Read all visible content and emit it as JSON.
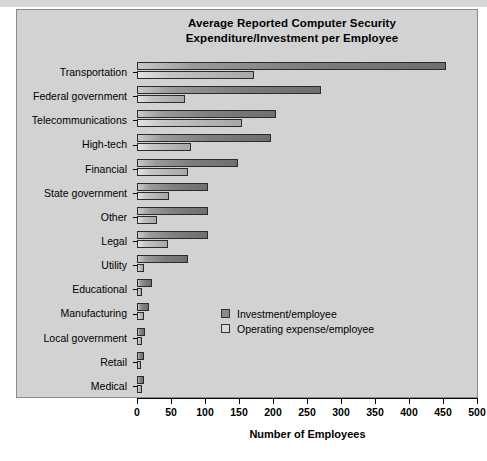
{
  "chart_data": {
    "type": "bar",
    "orientation": "horizontal",
    "title": "Average Reported Computer Security Expenditure/Investment per Employee",
    "title_lines": [
      "Average Reported Computer Security",
      "Expenditure/Investment per Employee"
    ],
    "xlabel": "Number of Employees",
    "ylabel": "",
    "xlim": [
      0,
      500
    ],
    "xticks": [
      0,
      50,
      100,
      150,
      200,
      250,
      300,
      350,
      400,
      450,
      500
    ],
    "xtick_labels": [
      "0",
      "50",
      "100",
      "150",
      "200",
      "250",
      "300",
      "350",
      "400",
      "450",
      "500"
    ],
    "grid": false,
    "legend_position": "center-right",
    "categories": [
      "Transportation",
      "Federal government",
      "Telecommunications",
      "High-tech",
      "Financial",
      "State government",
      "Other",
      "Legal",
      "Utility",
      "Educational",
      "Manufacturing",
      "Local government",
      "Retail",
      "Medical"
    ],
    "series": [
      {
        "name": "Investment/employee",
        "color": "#7d7d7d",
        "values": [
          455,
          270,
          205,
          197,
          148,
          105,
          105,
          105,
          75,
          22,
          17,
          12,
          11,
          10
        ]
      },
      {
        "name": "Operating expense/employee",
        "color": "#c2c2c2",
        "values": [
          172,
          70,
          155,
          80,
          75,
          47,
          30,
          45,
          10,
          8,
          10,
          8,
          6,
          7
        ]
      }
    ],
    "legend": [
      "Investment/employee",
      "Operating expense/employee"
    ]
  },
  "panel": {
    "background": "#d2d2d2",
    "border": "#8a8a8a"
  }
}
